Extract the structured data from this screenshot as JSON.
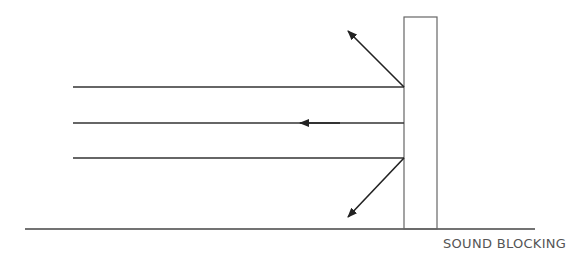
{
  "diagram": {
    "caption": "SOUND BLOCKING",
    "colors": {
      "line": "#333333",
      "wall": "#666666",
      "text": "#555555",
      "background": "#ffffff"
    },
    "elements": {
      "ground_line": {
        "x1": 25,
        "y1": 229,
        "x2": 535,
        "y2": 229
      },
      "wall": {
        "x": 404,
        "y": 17,
        "width": 33,
        "height": 212
      },
      "incoming_waves": [
        {
          "y": 87,
          "x_start": 73,
          "x_end": 404
        },
        {
          "y": 123,
          "x_start": 73,
          "x_end": 404
        },
        {
          "y": 158,
          "x_start": 73,
          "x_end": 404
        }
      ],
      "reflected_arrows": [
        {
          "from": [
            404,
            87
          ],
          "to": [
            347,
            30
          ],
          "direction": "up-left"
        },
        {
          "from": [
            404,
            123
          ],
          "to": [
            298,
            123
          ],
          "direction": "left"
        },
        {
          "from": [
            404,
            158
          ],
          "to": [
            347,
            218
          ],
          "direction": "down-left"
        }
      ]
    }
  }
}
